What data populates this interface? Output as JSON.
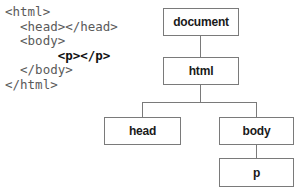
{
  "code": {
    "lines": [
      {
        "indent": 0,
        "text": "<html>"
      },
      {
        "indent": 1,
        "text": "<head></head>"
      },
      {
        "indent": 1,
        "text": "<body>"
      },
      {
        "indent": 2,
        "text": "<p></p>"
      },
      {
        "indent": 1,
        "text": "</body>"
      },
      {
        "indent": 0,
        "text": "</html>"
      }
    ],
    "highlighted_line": 3
  },
  "tree": {
    "nodes": {
      "document": {
        "label": "document"
      },
      "html": {
        "label": "html"
      },
      "head": {
        "label": "head"
      },
      "body": {
        "label": "body"
      },
      "p": {
        "label": "p"
      }
    },
    "edges": [
      [
        "document",
        "html"
      ],
      [
        "html",
        "head"
      ],
      [
        "html",
        "body"
      ],
      [
        "body",
        "p"
      ]
    ]
  },
  "colors": {
    "code_text": "#5a5a5a",
    "code_highlight": "#111111",
    "box_border": "#7a7a7a",
    "node_text": "#1a1a1a"
  }
}
